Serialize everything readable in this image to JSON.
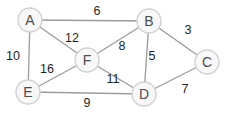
{
  "diagram": {
    "background_color": "#ffffff",
    "node_fill_color": "#f8f8f8",
    "node_border_color": "#d2d2d2",
    "node_text_color": "#4d4d4d",
    "edge_color": "#9b9b9b",
    "weight_text_color": "#1f1f1f",
    "node_radius": 12,
    "nodes": [
      {
        "id": "A",
        "label": "A",
        "x": 30,
        "y": 20
      },
      {
        "id": "B",
        "label": "B",
        "x": 149,
        "y": 21
      },
      {
        "id": "C",
        "label": "C",
        "x": 207,
        "y": 62
      },
      {
        "id": "D",
        "label": "D",
        "x": 144,
        "y": 94
      },
      {
        "id": "E",
        "label": "E",
        "x": 28,
        "y": 92
      },
      {
        "id": "F",
        "label": "F",
        "x": 87,
        "y": 60
      }
    ],
    "edges": [
      {
        "from": "A",
        "to": "B",
        "weight": "6",
        "label_x": 97,
        "label_y": 11
      },
      {
        "from": "A",
        "to": "F",
        "weight": "12",
        "label_x": 72,
        "label_y": 38
      },
      {
        "from": "A",
        "to": "E",
        "weight": "10",
        "label_x": 13,
        "label_y": 56
      },
      {
        "from": "E",
        "to": "F",
        "weight": "16",
        "label_x": 47,
        "label_y": 69
      },
      {
        "from": "E",
        "to": "D",
        "weight": "9",
        "label_x": 87,
        "label_y": 103
      },
      {
        "from": "F",
        "to": "D",
        "weight": "11",
        "label_x": 113,
        "label_y": 79
      },
      {
        "from": "F",
        "to": "B",
        "weight": "8",
        "label_x": 122,
        "label_y": 46
      },
      {
        "from": "B",
        "to": "D",
        "weight": "5",
        "label_x": 152,
        "label_y": 56
      },
      {
        "from": "B",
        "to": "C",
        "weight": "3",
        "label_x": 188,
        "label_y": 30
      },
      {
        "from": "C",
        "to": "D",
        "weight": "7",
        "label_x": 185,
        "label_y": 89
      }
    ]
  }
}
